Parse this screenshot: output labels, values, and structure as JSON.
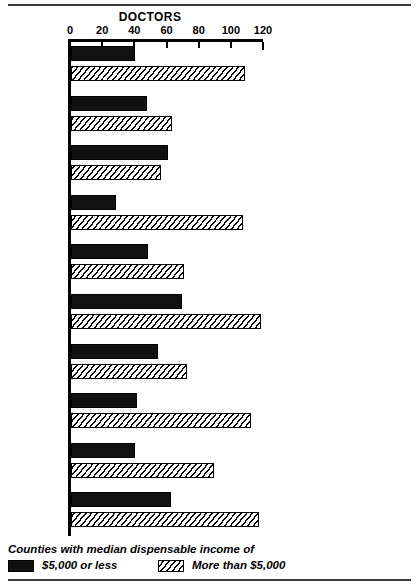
{
  "chart_data": {
    "type": "bar",
    "orientation": "horizontal",
    "title": "DOCTORS",
    "xlabel": "",
    "ylabel": "",
    "xlim": [
      0,
      120
    ],
    "xticks": [
      0,
      20,
      40,
      60,
      80,
      100,
      120
    ],
    "grid": false,
    "legend_position": "bottom",
    "legend_caption": "Counties with median dispensable income of",
    "categories": [
      "Alabama",
      "Georgia",
      "Kentucky",
      "Maryland",
      "Mississippi",
      "North\nCarolina",
      "Ohio",
      "Tennessee",
      "Virginia",
      "West\nVirginia"
    ],
    "series": [
      {
        "name": "$5,000 or less",
        "pattern": "solid-black",
        "values": [
          40,
          47,
          60,
          28,
          48,
          69,
          54,
          41,
          40,
          62
        ]
      },
      {
        "name": "More than $5,000",
        "pattern": "diagonal-hatch",
        "values": [
          108,
          63,
          56,
          107,
          70,
          118,
          72,
          112,
          89,
          117
        ]
      }
    ]
  },
  "legend": {
    "caption": "Counties with median dispensable income of",
    "item_a": "$5,000 or less",
    "item_b": "More than $5,000"
  }
}
